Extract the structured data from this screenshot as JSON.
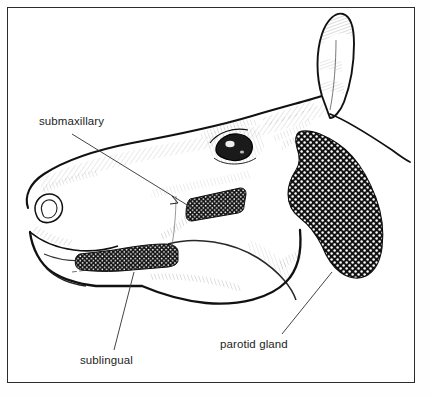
{
  "figure": {
    "kind": "anatomical-line-drawing",
    "topic": "salivary glands",
    "style": "black ink pen-and-ink hatching on white",
    "border_color": "#2b2b2b",
    "ink_color": "#1d1d1d",
    "background_color": "#ffffff"
  },
  "labels": [
    {
      "id": "submaxillary",
      "text": "submaxillary",
      "x": 39,
      "y": 115,
      "leader": "from label right edge down-right to the elongated dark gland band under the cheek"
    },
    {
      "id": "sublingual",
      "text": "sublingual",
      "x": 80,
      "y": 354,
      "leader": "from label up-right to the horizontal dark gland band along the lower jaw"
    },
    {
      "id": "parotid_gland",
      "text": "parotid gland",
      "x": 220,
      "y": 338,
      "leader": "from label up-right to the large stippled gland mass behind the jaw"
    }
  ],
  "glands": [
    {
      "id": "parotid",
      "label": "parotid gland",
      "rendering": "large coarse stippled / granular dark mass",
      "location": "behind the jaw below the ear"
    },
    {
      "id": "submaxillary",
      "label": "submaxillary",
      "rendering": "elongated diagonal dark band with white speckles",
      "location": "mid-cheek, angled down-left to up-right"
    },
    {
      "id": "sublingual",
      "label": "sublingual",
      "rendering": "horizontal dark band with white stipple",
      "location": "along the lower jaw toward the muzzle"
    }
  ],
  "anatomy_features": [
    {
      "id": "ear",
      "name": "ear"
    },
    {
      "id": "eye",
      "name": "eye"
    },
    {
      "id": "nostril",
      "name": "nostril"
    },
    {
      "id": "muzzle",
      "name": "muzzle"
    },
    {
      "id": "jaw",
      "name": "jaw line"
    },
    {
      "id": "neck",
      "name": "neck line"
    }
  ]
}
